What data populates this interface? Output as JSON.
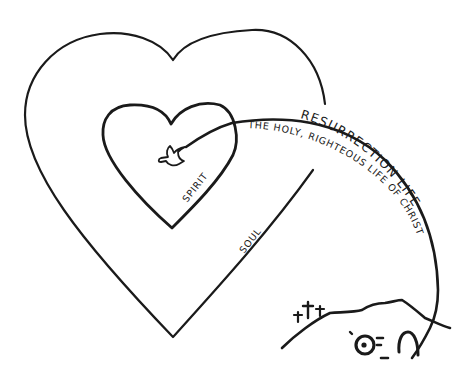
{
  "diagram": {
    "labels": {
      "resurrection": "RESURRECTION LIFE",
      "holy_life": "THE HOLY, RIGHTEOUS LIFE OF CHRIST",
      "spirit": "SPIRIT",
      "soul": "SOUL"
    },
    "elements": [
      {
        "id": "outer-heart",
        "represents": "Soul"
      },
      {
        "id": "inner-heart",
        "represents": "Spirit"
      },
      {
        "id": "dove",
        "represents": "Holy Spirit"
      },
      {
        "id": "resurrection-path",
        "from": "empty tomb",
        "to": "dove in spirit"
      },
      {
        "id": "hill-with-three-crosses",
        "represents": "Calvary"
      },
      {
        "id": "empty-tomb",
        "represents": "Resurrection"
      }
    ],
    "ink_color": "#1a1a1a",
    "background_color": "#ffffff"
  }
}
